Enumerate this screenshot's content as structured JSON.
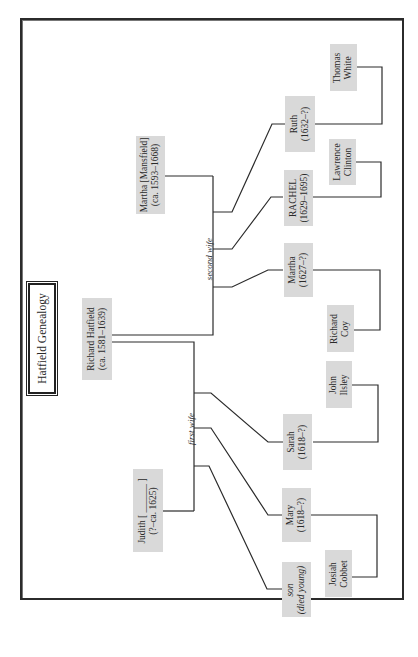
{
  "title": "Hatfield Genealogy",
  "colors": {
    "box_fill": "#d9d9d9",
    "line": "#2b2b2b",
    "frame": "#2b2b2b"
  },
  "orientation": "rotated 90 degrees counter-clockwise",
  "people": {
    "richard": {
      "name": "Richard Hatfield",
      "dates": "(ca. 1581–1639)"
    },
    "martha_mansfield": {
      "name": "Martha [Mansfield]",
      "dates": "(ca. 1593–1668)"
    },
    "judith": {
      "name": "Judith [ ______ ]",
      "dates": "(?–ca. 1625)"
    },
    "ruth": {
      "name": "Ruth",
      "dates": "(1632–?)"
    },
    "rachel": {
      "name": "RACHEL",
      "dates": "(1629–1695)"
    },
    "martha": {
      "name": "Martha",
      "dates": "(1627–?)"
    },
    "sarah": {
      "name": "Sarah",
      "dates": "(1618–?)"
    },
    "mary": {
      "name": "Mary",
      "dates": "(1618–?)"
    },
    "son": {
      "name": "son",
      "dates": "(died young)"
    },
    "thomas_white": {
      "line1": "Thomas",
      "line2": "White"
    },
    "lawrence_clinton": {
      "line1": "Lawrence",
      "line2": "Clinton"
    },
    "richard_coy": {
      "line1": "Richard",
      "line2": "Coy"
    },
    "john_ilsley": {
      "line1": "John",
      "line2": "Ilsley"
    },
    "josiah_cobbet": {
      "line1": "Josiah",
      "line2": "Cobbet"
    }
  },
  "labels": {
    "second_wife": "second wife",
    "first_wife": "first wife"
  },
  "relationships": [
    {
      "parent": "Richard Hatfield",
      "spouse": "Martha [Mansfield]",
      "label": "second wife",
      "children": [
        "Ruth",
        "RACHEL",
        "Martha"
      ]
    },
    {
      "parent": "Richard Hatfield",
      "spouse": "Judith",
      "label": "first wife",
      "children": [
        "Sarah",
        "Mary",
        "son"
      ]
    },
    {
      "person": "Ruth",
      "married": "Thomas White"
    },
    {
      "person": "RACHEL",
      "married": "Lawrence Clinton"
    },
    {
      "person": "Martha",
      "married": "Richard Coy"
    },
    {
      "person": "Sarah",
      "married": "John Ilsley"
    },
    {
      "person": "Mary",
      "married": "Josiah Cobbet"
    }
  ]
}
